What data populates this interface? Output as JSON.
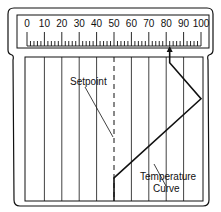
{
  "scale": {
    "labels": [
      "0",
      "10",
      "20",
      "30",
      "40",
      "50",
      "60",
      "70",
      "80",
      "90",
      "100"
    ],
    "min": 0,
    "max": 100,
    "indicator_value": 82
  },
  "annotations": {
    "setpoint": "Setpoint",
    "temperature_curve_line1": "Temperature",
    "temperature_curve_line2": "Curve"
  },
  "chart": {
    "setpoint_value": 50,
    "gridline_values": [
      10,
      20,
      30,
      40,
      60,
      70,
      80,
      90
    ],
    "curve_points": [
      [
        50,
        1.0
      ],
      [
        50,
        0.84
      ],
      [
        100,
        0.29
      ],
      [
        82,
        0.04
      ],
      [
        82,
        0.0
      ]
    ]
  },
  "colors": {
    "line": "#111111",
    "background": "#ffffff"
  }
}
